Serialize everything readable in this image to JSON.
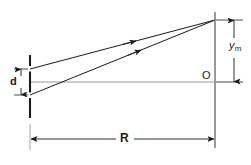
{
  "figure": {
    "kind": "optics-double-slit-geometry",
    "background_color": "#ffffff",
    "line_color": "#1a1a1a",
    "axis_color": "#8a8a8a",
    "labels": {
      "slit_separation": "d",
      "screen_distance": "R",
      "center_point": "O",
      "fringe_height_base": "y",
      "fringe_height_sub": "m"
    },
    "elements": {
      "barrier_name": "slit-barrier",
      "screen_name": "observation-screen",
      "ray_upper_name": "ray-from-upper-slit",
      "ray_lower_name": "ray-from-lower-slit",
      "axis_name": "optical-axis",
      "dim_d_name": "dimension-d",
      "dim_R_name": "dimension-R",
      "dim_ym_name": "dimension-ym"
    },
    "geometry": {
      "barrier_x": 30,
      "barrier_top_y": 55,
      "barrier_bottom_y": 118,
      "slit_upper_y": 69,
      "slit_lower_y": 95,
      "screen_x": 215,
      "screen_top_y": 12,
      "screen_bottom_y": 148,
      "converge_y": 20,
      "axis_y": 82,
      "dim_d_x": 21,
      "dim_R_y": 139,
      "dim_ym_x": 234
    }
  }
}
